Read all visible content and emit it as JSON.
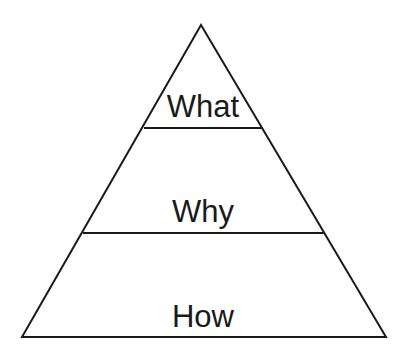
{
  "diagram": {
    "type": "pyramid",
    "levels": [
      {
        "label": "What",
        "position": "top"
      },
      {
        "label": "Why",
        "position": "middle"
      },
      {
        "label": "How",
        "position": "bottom"
      }
    ],
    "colors": {
      "stroke": "#1a1a1a",
      "background": "#ffffff",
      "text": "#1a1a1a"
    }
  }
}
